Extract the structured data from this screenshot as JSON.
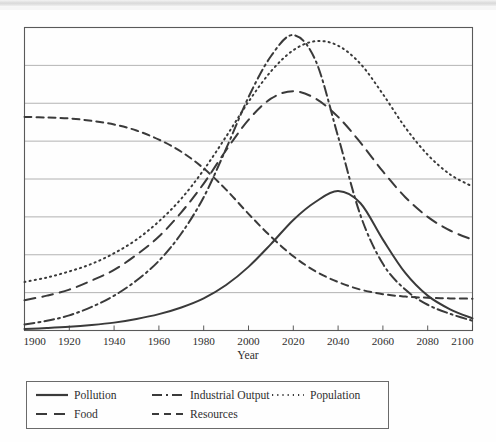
{
  "figure": {
    "background_color": "#fefefe",
    "line_color": "#3a3a3a",
    "grid_color": "#9a9a9a",
    "frame_color": "#5a5a5a"
  },
  "axis": {
    "xlabel": "Year",
    "ylabel": "",
    "x_ticks": [
      "1900",
      "1920",
      "1940",
      "1960",
      "1980",
      "2000",
      "2020",
      "2040",
      "2060",
      "2080",
      "2100"
    ],
    "y_ticks": [],
    "grid": "horizontal",
    "gridline_count": 7
  },
  "legend": {
    "position": "below-plot",
    "entries": [
      {
        "label": "Pollution",
        "style": "solid",
        "dash": "none"
      },
      {
        "label": "Industrial Output",
        "style": "dash-dot",
        "dash": "10 4 2 4"
      },
      {
        "label": "Population",
        "style": "dotted",
        "dash": "1.2 4"
      },
      {
        "label": "Food",
        "style": "long-dash",
        "dash": "11 7"
      },
      {
        "label": "Resources",
        "style": "dashed",
        "dash": "7 5"
      }
    ]
  },
  "chart_data": {
    "type": "line",
    "title": "",
    "subtitle": "",
    "xlabel": "Year",
    "ylabel": "",
    "xlim": [
      1900,
      2100
    ],
    "ylim": [
      0,
      100
    ],
    "grid": true,
    "legend_position": "bottom",
    "x": [
      1900,
      1910,
      1920,
      1930,
      1940,
      1950,
      1960,
      1970,
      1980,
      1990,
      2000,
      2010,
      2020,
      2030,
      2040,
      2050,
      2060,
      2070,
      2080,
      2090,
      2100
    ],
    "series": [
      {
        "name": "Pollution",
        "style": "solid",
        "values": [
          0.5,
          0.8,
          1.2,
          1.8,
          2.6,
          3.8,
          5.4,
          7.6,
          10.6,
          15.0,
          21.0,
          28.5,
          36.5,
          42.5,
          46.0,
          42.0,
          30.0,
          19.0,
          11.5,
          7.0,
          4.0
        ]
      },
      {
        "name": "Industrial Output",
        "style": "dash-dot",
        "values": [
          2.0,
          3.2,
          5.0,
          7.8,
          11.5,
          16.5,
          23.0,
          32.0,
          44.0,
          60.0,
          77.0,
          90.5,
          97.5,
          89.0,
          64.0,
          38.0,
          22.0,
          13.5,
          8.5,
          5.5,
          3.2
        ]
      },
      {
        "name": "Population",
        "style": "dotted",
        "values": [
          16.0,
          17.5,
          19.5,
          22.0,
          25.5,
          30.0,
          36.0,
          43.5,
          53.0,
          64.0,
          75.5,
          85.5,
          92.5,
          95.5,
          94.0,
          88.0,
          78.0,
          67.0,
          58.0,
          51.5,
          47.5
        ]
      },
      {
        "name": "Food",
        "style": "long-dash",
        "values": [
          10.0,
          11.5,
          13.5,
          16.5,
          20.0,
          25.0,
          31.0,
          39.0,
          48.5,
          59.5,
          69.5,
          76.5,
          79.0,
          76.5,
          70.5,
          62.0,
          52.5,
          44.0,
          37.5,
          33.0,
          30.0
        ]
      },
      {
        "name": "Resources",
        "style": "dashed",
        "values": [
          70.5,
          70.3,
          70.0,
          69.2,
          68.0,
          66.0,
          63.0,
          59.0,
          53.5,
          46.5,
          38.5,
          31.0,
          24.5,
          19.5,
          16.0,
          13.5,
          12.0,
          11.2,
          10.8,
          10.6,
          10.5
        ]
      }
    ],
    "annotations": {
      "industrial_output_peak_year": 2022,
      "population_peak_year": 2033,
      "food_peak_year": 2020,
      "pollution_peak_year": 2044
    }
  }
}
